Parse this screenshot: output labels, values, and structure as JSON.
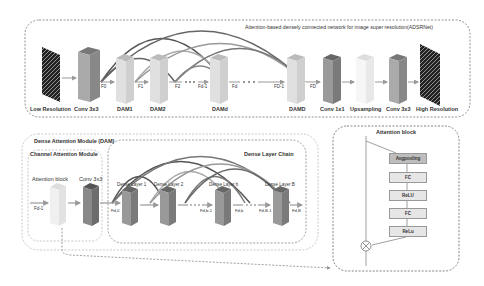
{
  "adsrnet": {
    "title": "Attention-based densely connected network for image super resolution(ADSRNet)",
    "blocks": [
      {
        "label": "Low Resolution"
      },
      {
        "label": "Conv 3x3"
      },
      {
        "label": "DAM1"
      },
      {
        "label": "DAM2"
      },
      {
        "label": "DAMd"
      },
      {
        "label": "DAMD"
      },
      {
        "label": "Conv 1x1"
      },
      {
        "label": "Upsampling"
      },
      {
        "label": "Conv 3x3"
      },
      {
        "label": "High Resolution"
      }
    ],
    "features": [
      "F0",
      "F1",
      "F2",
      "Fd-1",
      "Fd",
      "FD-1",
      "FD"
    ],
    "ellipsis": ". . ."
  },
  "dam": {
    "title": "Dense Attention Module (DAM)",
    "channel_attention": {
      "title": "Channel Attention Module",
      "attention_block_label": "Attention block",
      "conv_label": "Conv 3x3",
      "input_feature": "Fd-1"
    },
    "dense_chain": {
      "title": "Dense Layer Chain",
      "layers": [
        {
          "label": "Dense Layer 1"
        },
        {
          "label": "Dense Layer 2"
        },
        {
          "label": "Dense Layer b"
        },
        {
          "label": "Dense Layer B"
        }
      ],
      "features": [
        "Fd,0",
        "Fd,b-1",
        "Fd,b",
        "Fd,B-1",
        "Fd,B"
      ],
      "ellipsis": ". . ."
    }
  },
  "attention_block": {
    "title": "Attention block",
    "steps": [
      "Avgpooling",
      "FC",
      "ReLU",
      "FC",
      "ReLu"
    ],
    "multiply_symbol": "⊗"
  },
  "colors": {
    "border": "#888888",
    "arc_dark": "#555555",
    "arc_light": "#aaaaaa",
    "block_light": "#d9d9d9",
    "block_dark": "#8c8c8c"
  }
}
